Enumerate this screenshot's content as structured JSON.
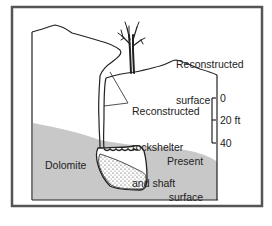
{
  "diagram": {
    "labels": {
      "reconstructed_surface_line1": "Reconstructed",
      "reconstructed_surface_line2": "surface",
      "rockshelter_line1": "Reconstructed",
      "rockshelter_line2": "rockshelter",
      "rockshelter_line3": "and shaft",
      "present_surface_line1": "Present",
      "present_surface_line2": "surface",
      "dolomite": "Dolomite"
    },
    "scale": {
      "tick_0": "0",
      "tick_20": "20 ft",
      "tick_40": "40"
    },
    "colors": {
      "frame": "#555555",
      "dolomite_fill": "#c8c8c8",
      "line": "#222222",
      "background": "#ffffff"
    }
  }
}
